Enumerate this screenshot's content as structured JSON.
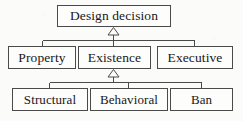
{
  "diagram": {
    "type": "uml-generalization-hierarchy",
    "background_color": "#fbfbfa",
    "border_color": "#4a4a4a",
    "box_fill_color": "#fdfdfc",
    "text_color": "#17171a",
    "nodes": [
      {
        "id": "design-decision",
        "label": "Design decision",
        "level": 0,
        "x": 57,
        "y": 5,
        "w": 114,
        "h": 22
      },
      {
        "id": "property",
        "label": "Property",
        "level": 1,
        "x": 8,
        "y": 46,
        "w": 68,
        "h": 23
      },
      {
        "id": "existence",
        "label": "Existence",
        "level": 1,
        "x": 78,
        "y": 46,
        "w": 73,
        "h": 23
      },
      {
        "id": "executive",
        "label": "Executive",
        "level": 1,
        "x": 157,
        "y": 46,
        "w": 76,
        "h": 23
      },
      {
        "id": "structural",
        "label": "Structural",
        "level": 2,
        "x": 12,
        "y": 88,
        "w": 76,
        "h": 23
      },
      {
        "id": "behavioral",
        "label": "Behavioral",
        "level": 2,
        "x": 90,
        "y": 88,
        "w": 78,
        "h": 23
      },
      {
        "id": "ban",
        "label": "Ban",
        "level": 2,
        "x": 170,
        "y": 88,
        "w": 63,
        "h": 23
      }
    ],
    "edges": [
      {
        "id": "edge-property-to-design-decision",
        "from": "property",
        "to": "design-decision",
        "arrow": "hollow-triangle"
      },
      {
        "id": "edge-existence-to-design-decision",
        "from": "existence",
        "to": "design-decision",
        "arrow": "hollow-triangle"
      },
      {
        "id": "edge-executive-to-design-decision",
        "from": "executive",
        "to": "design-decision",
        "arrow": "hollow-triangle"
      },
      {
        "id": "edge-structural-to-existence",
        "from": "structural",
        "to": "existence",
        "arrow": "hollow-triangle"
      },
      {
        "id": "edge-behavioral-to-existence",
        "from": "behavioral",
        "to": "existence",
        "arrow": "hollow-triangle"
      },
      {
        "id": "edge-ban-to-existence",
        "from": "ban",
        "to": "existence",
        "arrow": "hollow-triangle"
      }
    ]
  }
}
